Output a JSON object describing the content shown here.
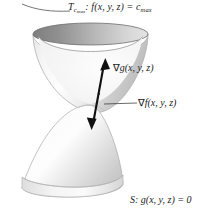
{
  "figure": {
    "title_label": "T",
    "background_color": "#ffffff",
    "ink_color": "#1a1a1a"
  },
  "labels": {
    "level_surface": {
      "symbol": "T",
      "subscript": "c",
      "sub_subscript": "max",
      "relation": ": f(x, y, z) = c",
      "relation_subscript": "max",
      "full_text": "T_c_max : f(x, y, z) = c_max"
    },
    "gradient_g": {
      "nabla": "∇",
      "text": "g(x, y, z)",
      "full_text": "∇g(x, y, z)"
    },
    "gradient_f": {
      "leader": "—",
      "nabla": "∇",
      "text": "f(x, y, z)",
      "full_text": "∇f(x, y, z)"
    },
    "constraint_surface": {
      "full_text": "S: g(x, y, z) = 0"
    }
  },
  "surfaces": {
    "upper": {
      "name": "level-surface-paraboloid",
      "rim_fill_dark": "#8d8d8d",
      "rim_fill_light": "#d8d8d8",
      "body_fill_light": "#fbfbfb",
      "body_fill_mid": "#d0d0d0",
      "outline": "#9a9a9a"
    },
    "lower": {
      "name": "constraint-surface-dome",
      "body_fill_light": "#fdfdfd",
      "body_fill_mid": "#d4d4d4",
      "base_fill": "#e9e9e9",
      "outline": "#a5a5a5"
    }
  },
  "arrows": {
    "double_headed": {
      "name": "gradient-double-arrow",
      "color": "#111111",
      "up_tip": "↑",
      "down_tip": "↓"
    },
    "leaders": {
      "top": "curved-leader-line",
      "middle": "straight-leader-line"
    }
  }
}
